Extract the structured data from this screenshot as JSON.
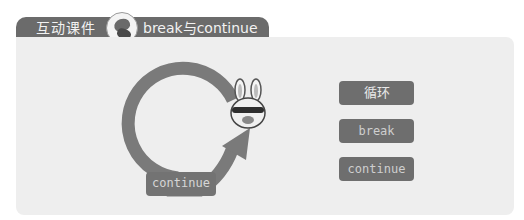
{
  "header": {
    "title": "互动课件",
    "subtitle": "break与continue",
    "mascot_icon": "running-character-icon"
  },
  "diagram": {
    "loop_label": "continue",
    "arrow_icon": "loop-arrow-icon",
    "character_icon": "bunny-character-icon"
  },
  "buttons": [
    {
      "label": "循环"
    },
    {
      "label": "break"
    },
    {
      "label": "continue"
    }
  ],
  "colors": {
    "tab": "#6b6b6b",
    "panel": "#eeeeee",
    "button": "#6e6e6e",
    "loop": "#7a7a7a"
  }
}
